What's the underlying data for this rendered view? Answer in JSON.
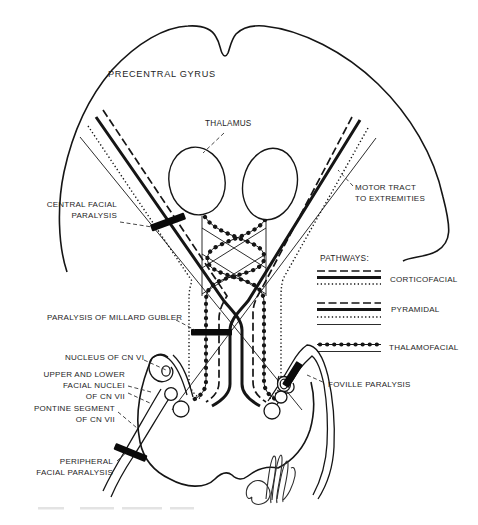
{
  "figure": {
    "background": "#ffffff",
    "ink_color": "#151515",
    "labels": {
      "precentral_gyrus": "PRECENTRAL GYRUS",
      "thalamus": "THALAMUS",
      "motor_tract": [
        "MOTOR TRACT",
        "TO EXTREMITIES"
      ],
      "central_facial_paralysis": [
        "CENTRAL FACIAL",
        "PARALYSIS"
      ],
      "millard_gubler": "PARALYSIS OF MILLARD GUBLER",
      "nucleus_cn_vi": "NUCLEUS OF CN VI",
      "facial_nuclei_cn_vii": [
        "UPPER AND LOWER",
        "FACIAL NUCLEI",
        "OF CN VII"
      ],
      "pontine_segment": [
        "PONTINE SEGMENT",
        "OF CN VII"
      ],
      "peripheral_facial_paralysis": [
        "PERIPHERAL",
        "FACIAL PARALYSIS"
      ],
      "foville_paralysis": "FOVILLE PARALYSIS"
    },
    "legend": {
      "title": "PATHWAYS:",
      "entries": [
        {
          "label": "CORTICOFACIAL",
          "line_styles": [
            "dashed",
            "solid-thick",
            "dotted"
          ]
        },
        {
          "label": "PYRAMIDAL",
          "line_styles": [
            "dashed",
            "solid-thick",
            "dotted",
            "solid-thin"
          ]
        },
        {
          "label": "THALAMOFACIAL",
          "line_styles": [
            "beaded",
            "solid-thin"
          ]
        }
      ]
    }
  }
}
